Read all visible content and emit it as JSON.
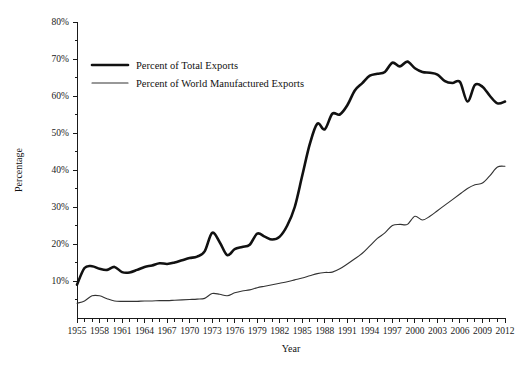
{
  "chart_data": {
    "type": "line",
    "title": "",
    "xlabel": "Year",
    "ylabel": "Percentage",
    "xlim": [
      1955,
      2012
    ],
    "ylim": [
      0,
      80
    ],
    "grid": false,
    "legend_position": "upper-left-inside",
    "y_ticks": [
      10,
      20,
      30,
      40,
      50,
      60,
      70,
      80
    ],
    "y_tick_labels": [
      "10%",
      "20%",
      "30%",
      "40%",
      "50%",
      "60%",
      "70%",
      "80%"
    ],
    "x_ticks": [
      1955,
      1956,
      1957,
      1958,
      1959,
      1960,
      1961,
      1962,
      1963,
      1964,
      1965,
      1966,
      1967,
      1968,
      1969,
      1970,
      1971,
      1972,
      1973,
      1974,
      1975,
      1976,
      1977,
      1978,
      1979,
      1980,
      1981,
      1982,
      1983,
      1984,
      1985,
      1986,
      1987,
      1988,
      1989,
      1990,
      1991,
      1992,
      1993,
      1994,
      1995,
      1996,
      1997,
      1998,
      1999,
      2000,
      2001,
      2002,
      2003,
      2004,
      2005,
      2006,
      2007,
      2008,
      2009,
      2010,
      2011,
      2012
    ],
    "x_tick_labels": [
      "1955",
      "1958",
      "1961",
      "1964",
      "1967",
      "1970",
      "1973",
      "1976",
      "1979",
      "1982",
      "1985",
      "1988",
      "1991",
      "1994",
      "1997",
      "2000",
      "2003",
      "2006",
      "2009",
      "2012"
    ],
    "x_tick_label_years": [
      1955,
      1958,
      1961,
      1964,
      1967,
      1970,
      1973,
      1976,
      1979,
      1982,
      1985,
      1988,
      1991,
      1994,
      1997,
      2000,
      2003,
      2006,
      2009,
      2012
    ],
    "x": [
      1955,
      1956,
      1957,
      1958,
      1959,
      1960,
      1961,
      1962,
      1963,
      1964,
      1965,
      1966,
      1967,
      1968,
      1969,
      1970,
      1971,
      1972,
      1973,
      1974,
      1975,
      1976,
      1977,
      1978,
      1979,
      1980,
      1981,
      1982,
      1983,
      1984,
      1985,
      1986,
      1987,
      1988,
      1989,
      1990,
      1991,
      1992,
      1993,
      1994,
      1995,
      1996,
      1997,
      1998,
      1999,
      2000,
      2001,
      2002,
      2003,
      2004,
      2005,
      2006,
      2007,
      2008,
      2009,
      2010,
      2011,
      2012
    ],
    "series": [
      {
        "name": "Percent of Total Exports",
        "style": "thick",
        "color": "#111111",
        "values": [
          9.0,
          13.5,
          14.0,
          13.3,
          13.0,
          13.8,
          12.4,
          12.3,
          13.0,
          13.8,
          14.2,
          14.8,
          14.6,
          15.0,
          15.6,
          16.2,
          16.6,
          18.0,
          23.0,
          20.5,
          17.0,
          18.6,
          19.2,
          19.8,
          22.8,
          22.0,
          21.2,
          22.0,
          25.0,
          30.0,
          38.5,
          47.0,
          52.5,
          51.0,
          55.2,
          55.0,
          57.5,
          61.5,
          63.5,
          65.5,
          66.0,
          66.5,
          69.0,
          68.0,
          69.3,
          67.5,
          66.5,
          66.3,
          65.8,
          64.0,
          63.5,
          63.8,
          58.5,
          63.0,
          62.5,
          60.0,
          58.0,
          58.5
        ]
      },
      {
        "name": "Percent of World Manufactured Exports",
        "style": "thin",
        "color": "#333333",
        "values": [
          4.0,
          4.6,
          6.0,
          6.0,
          5.2,
          4.6,
          4.5,
          4.5,
          4.5,
          4.6,
          4.6,
          4.7,
          4.7,
          4.8,
          4.9,
          5.0,
          5.1,
          5.3,
          6.6,
          6.4,
          6.0,
          6.8,
          7.3,
          7.6,
          8.2,
          8.6,
          9.0,
          9.4,
          9.8,
          10.3,
          10.8,
          11.4,
          12.0,
          12.3,
          12.4,
          13.3,
          14.6,
          16.0,
          17.5,
          19.5,
          21.5,
          23.0,
          25.0,
          25.3,
          25.3,
          27.5,
          26.5,
          27.5,
          29.0,
          30.5,
          32.0,
          33.5,
          35.0,
          36.0,
          36.5,
          38.5,
          40.8,
          41.0
        ]
      }
    ]
  },
  "legend": {
    "items": [
      {
        "label": "Percent of Total Exports",
        "style": "thick"
      },
      {
        "label": "Percent of World Manufactured Exports",
        "style": "thin"
      }
    ]
  },
  "axes": {
    "x_title": "Year",
    "y_title": "Percentage"
  }
}
